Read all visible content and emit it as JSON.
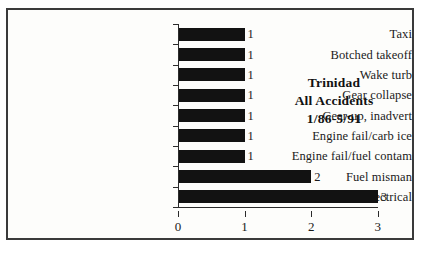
{
  "chart_data": {
    "type": "bar",
    "orientation": "horizontal",
    "title": "Trinidad",
    "subtitle": "All Accidents",
    "period": "1/86-5/91",
    "title_lines": [
      "Trinidad",
      "All Accidents",
      "1/86-5/91"
    ],
    "categories": [
      "Taxi",
      "Botched takeoff",
      "Wake turb",
      "Gear collapse",
      "Gear-up, inadvert",
      "Engine fail/carb ice",
      "Engine fail/fuel contam",
      "Fuel misman",
      "Electrical"
    ],
    "values": [
      1,
      1,
      1,
      1,
      1,
      1,
      1,
      2,
      3
    ],
    "value_labels": [
      "1",
      "1",
      "1",
      "1",
      "1",
      "1",
      "1",
      "2",
      "3"
    ],
    "xlabel": "",
    "ylabel": "",
    "xlim": [
      0,
      3
    ],
    "xticks": [
      0,
      1,
      2,
      3
    ],
    "xtick_labels": [
      "0",
      "1",
      "2",
      "3"
    ],
    "grid": false,
    "legend": false,
    "bar_color": "#121212",
    "axis_color": "#2b2b2b",
    "background_color": "#fdfdfb",
    "border_color": "#3a3a3a"
  }
}
